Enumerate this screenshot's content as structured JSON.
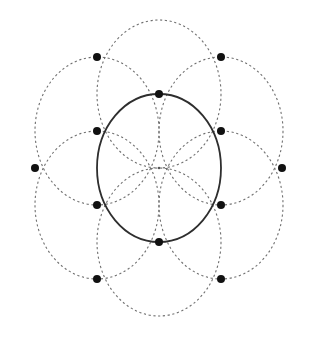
{
  "diagram": {
    "title": "",
    "canvas": {
      "width": 316,
      "height": 343,
      "background": "#ffffff"
    },
    "center": {
      "x": 159,
      "y": 168
    },
    "main_circle": {
      "cx": 159,
      "cy": 168,
      "rx": 62,
      "ry": 74,
      "style": "solid",
      "color": "#2e2e2e"
    },
    "dashed_circles": [
      {
        "cx": 159,
        "cy": 94,
        "rx": 62,
        "ry": 74
      },
      {
        "cx": 221,
        "cy": 131,
        "rx": 62,
        "ry": 74
      },
      {
        "cx": 221,
        "cy": 205,
        "rx": 62,
        "ry": 74
      },
      {
        "cx": 159,
        "cy": 242,
        "rx": 62,
        "ry": 74
      },
      {
        "cx": 97,
        "cy": 205,
        "rx": 62,
        "ry": 74
      },
      {
        "cx": 97,
        "cy": 131,
        "rx": 62,
        "ry": 74
      }
    ],
    "inner_points": [
      {
        "x": 159,
        "y": 94
      },
      {
        "x": 221,
        "y": 131
      },
      {
        "x": 221,
        "y": 205
      },
      {
        "x": 159,
        "y": 242
      },
      {
        "x": 97,
        "y": 205
      },
      {
        "x": 97,
        "y": 131
      }
    ],
    "outer_points": [
      {
        "x": 97,
        "y": 57
      },
      {
        "x": 221,
        "y": 57
      },
      {
        "x": 282,
        "y": 168
      },
      {
        "x": 221,
        "y": 279
      },
      {
        "x": 97,
        "y": 279
      },
      {
        "x": 35,
        "y": 168
      }
    ],
    "colors": {
      "dashed": "#6f6f6f",
      "solid": "#2e2e2e",
      "point": "#111111"
    },
    "point_radius": 4
  }
}
